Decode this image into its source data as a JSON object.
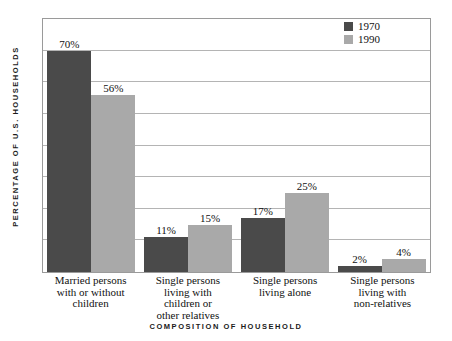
{
  "chart_data": {
    "type": "bar",
    "title": "",
    "subtitle": "",
    "xlabel": "COMPOSITION OF HOUSEHOLD",
    "ylabel": "PERCENTAGE OF U.S. HOUSEHOLDS",
    "ylim": [
      0,
      80
    ],
    "yticks": [
      0,
      10,
      20,
      30,
      40,
      50,
      60,
      70,
      80
    ],
    "ytick_labels": [],
    "grid": "horizontal",
    "legend_position": "top-right",
    "categories": [
      "Married persons with or without children",
      "Single persons living with children or other relatives",
      "Single persons living alone",
      "Single persons living with non-relatives"
    ],
    "category_label_lines": [
      [
        "Married persons",
        "with or without",
        "children"
      ],
      [
        "Single persons",
        "living with",
        "children or",
        "other relatives"
      ],
      [
        "Single persons",
        "living alone"
      ],
      [
        "Single persons",
        "living with",
        "non-relatives"
      ]
    ],
    "series": [
      {
        "name": "1970",
        "color": "#4a4a4a",
        "values": [
          70,
          11,
          17,
          2
        ],
        "value_labels": [
          "70%",
          "11%",
          "17%",
          "2%"
        ]
      },
      {
        "name": "1990",
        "color": "#a9a9a9",
        "values": [
          56,
          15,
          25,
          4
        ],
        "value_labels": [
          "56%",
          "15%",
          "25%",
          "4%"
        ]
      }
    ]
  },
  "legend": {
    "items": [
      {
        "label": "1970",
        "color": "#4a4a4a"
      },
      {
        "label": "1990",
        "color": "#a9a9a9"
      }
    ]
  },
  "colors": {
    "series_1970": "#4a4a4a",
    "series_1990": "#a9a9a9",
    "gridline": "#b4b4b4",
    "plot_border": "#9a9a9a",
    "background": "#ffffff",
    "text": "#111111"
  }
}
